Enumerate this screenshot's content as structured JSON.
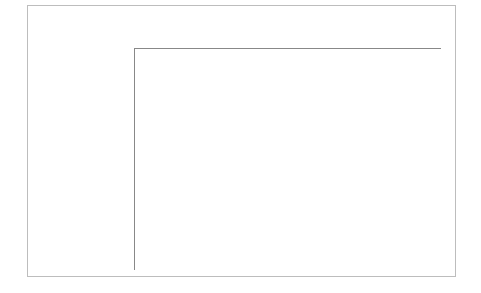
{
  "chart_data": {
    "type": "bar",
    "orientation": "horizontal",
    "title": "",
    "xlabel": "Lesions area (mm²)",
    "xlabel_parts": {
      "text": "Lesions area (mm",
      "sup": "2",
      "suffix": ")"
    },
    "ylabel": "",
    "xlim": [
      0,
      30
    ],
    "xticks": [
      "0",
      "5",
      "10",
      "15",
      "20",
      "25",
      "30"
    ],
    "x_axis_position": "top",
    "grid": false,
    "categories": [
      {
        "label": "Control",
        "italic": false,
        "bold_suffix": ""
      },
      {
        "label": "Q. coccifera",
        "italic": true,
        "bold_suffix": ""
      },
      {
        "label": "Q. suber",
        "italic": true,
        "bold_suffix": ""
      },
      {
        "label": "Pedunculagin (",
        "italic": false,
        "bold_suffix": "32",
        "close": ")"
      },
      {
        "label": "Phyllyraeoidin A",
        "italic": false,
        "line2_open": "(",
        "bold_suffix": "33",
        "close": ")"
      },
      {
        "label": "Castalagin (",
        "italic": false,
        "bold_suffix": "31",
        "close": ")"
      },
      {
        "label": "Acutissimin B",
        "italic": false,
        "bold_suffix": ""
      }
    ],
    "values": [
      22.0,
      6.0,
      7.1,
      7.6,
      8.2,
      4.1,
      5.2
    ],
    "errors": [
      2.0,
      2.0,
      1.5,
      1.6,
      2.0,
      1.0,
      1.0
    ],
    "bar_color": "#b3b3b3",
    "bar_edge_color": "#444444"
  }
}
